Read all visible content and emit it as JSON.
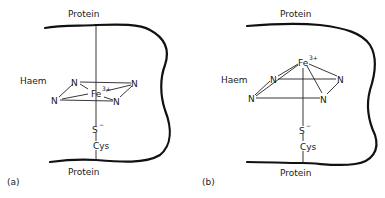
{
  "panels": [
    {
      "id": "a",
      "caption": "(a)",
      "protein_top": "Protein",
      "protein_bottom": "Protein",
      "haem_label": "Haem",
      "iron": "Fe",
      "iron_charge": "3+",
      "nitrogens": [
        "N",
        "N",
        "N",
        "N"
      ],
      "sulfur": "S",
      "sulfur_charge": "−",
      "cysteine": "Cys",
      "geometry": "iron in plane of haem"
    },
    {
      "id": "b",
      "caption": "(b)",
      "protein_top": "Protein",
      "protein_bottom": "Protein",
      "haem_label": "Haem",
      "iron": "Fe",
      "iron_charge": "3+",
      "nitrogens": [
        "N",
        "N",
        "N",
        "N"
      ],
      "sulfur": "S",
      "sulfur_charge": "−",
      "cysteine": "Cys",
      "geometry": "iron displaced above haem plane"
    }
  ],
  "colors": {
    "ink": "#1a1a1a",
    "background": "#ffffff"
  }
}
